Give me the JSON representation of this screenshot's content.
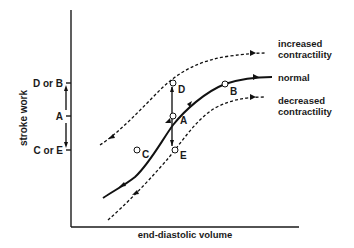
{
  "diagram": {
    "x_axis_label": "end-diastolic volume",
    "y_axis_label": "stroke work",
    "y_tick_labels": [
      "D or B",
      "A",
      "C or E"
    ],
    "curves": [
      {
        "id": "increased",
        "label_line1": "increased",
        "label_line2": "contractility",
        "style": "dashed"
      },
      {
        "id": "normal",
        "label_line1": "normal",
        "label_line2": "",
        "style": "solid"
      },
      {
        "id": "decreased",
        "label_line1": "decreased",
        "label_line2": "contractility",
        "style": "dashed"
      }
    ],
    "points": [
      {
        "id": "A",
        "label": "A",
        "curve": "normal"
      },
      {
        "id": "B",
        "label": "B",
        "curve": "normal"
      },
      {
        "id": "C",
        "label": "C",
        "curve": "normal"
      },
      {
        "id": "D",
        "label": "D",
        "curve": "increased"
      },
      {
        "id": "E",
        "label": "E",
        "curve": "decreased"
      }
    ]
  }
}
